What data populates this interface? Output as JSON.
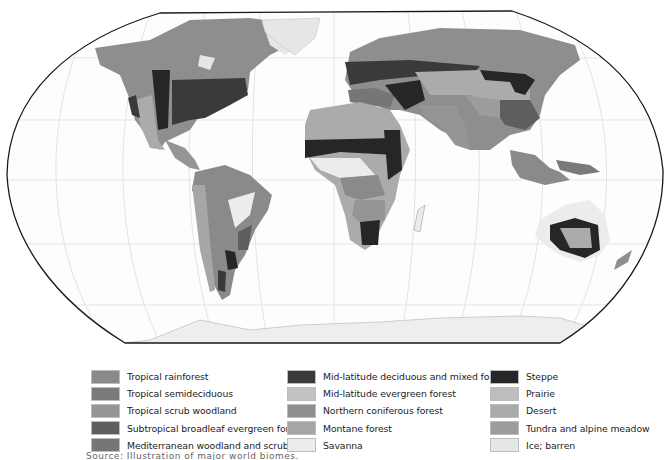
{
  "map": {
    "projection": "Robinson",
    "style": "grayscale world biome map",
    "outline_color": "#1a1a1a",
    "ocean_color": "#fdfdfd",
    "graticule_color": "#d6d6d6"
  },
  "legend": {
    "columns": [
      {
        "items": [
          {
            "label": "Tropical rainforest",
            "color": "#8a8a8a"
          },
          {
            "label": "Tropical semideciduous",
            "color": "#7a7a7a"
          },
          {
            "label": "Tropical scrub woodland",
            "color": "#959595"
          },
          {
            "label": "Subtropical broadleaf evergreen forest",
            "color": "#5e5e5e"
          },
          {
            "label": "Mediterranean woodland and scrub",
            "color": "#767676"
          }
        ]
      },
      {
        "items": [
          {
            "label": "Mid-latitude deciduous and mixed forest",
            "color": "#3a3a3a"
          },
          {
            "label": "Mid-latitude evergreen forest",
            "color": "#c2c2c2"
          },
          {
            "label": "Northern coniferous forest",
            "color": "#8e8e8e"
          },
          {
            "label": "Montane forest",
            "color": "#a6a6a6"
          },
          {
            "label": "Savanna",
            "color": "#ececec"
          }
        ]
      },
      {
        "items": [
          {
            "label": "Steppe",
            "color": "#262626"
          },
          {
            "label": "Prairie",
            "color": "#bdbdbd"
          },
          {
            "label": "Desert",
            "color": "#ababab"
          },
          {
            "label": "Tundra and alpine meadow",
            "color": "#9c9c9c"
          },
          {
            "label": "Ice; barren",
            "color": "#e6e6e6"
          }
        ]
      }
    ]
  },
  "caption": {
    "text": "Source: Illustration of major world biomes."
  }
}
